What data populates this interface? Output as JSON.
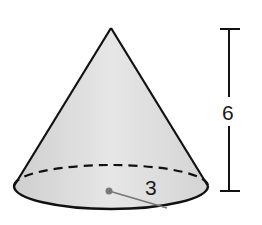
{
  "figure": {
    "type": "cone",
    "labels": {
      "height": "6",
      "radius": "3"
    },
    "colors": {
      "fill": "#dedede",
      "stroke": "#111111",
      "radius_line": "#777777"
    }
  }
}
